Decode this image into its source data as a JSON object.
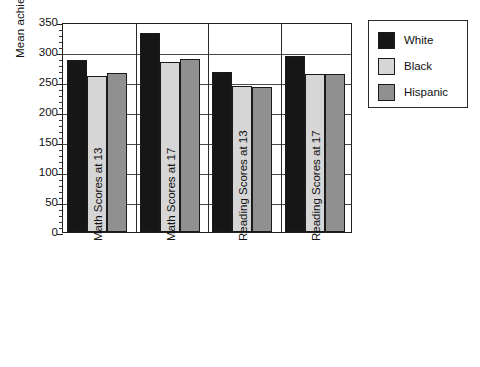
{
  "chart_data": {
    "type": "bar",
    "title": "",
    "xlabel": "",
    "ylabel": "Mean achievement score",
    "ylim": [
      0,
      350
    ],
    "ytick_step": 50,
    "yticks": [
      0,
      50,
      100,
      150,
      200,
      250,
      300,
      350
    ],
    "ytick_labels": [
      "0",
      "50",
      "100",
      "150",
      "200",
      "250",
      "300",
      "350"
    ],
    "grid": "horizontal",
    "legend_position": "right-outside",
    "categories": [
      "Math Scores at 13",
      "Math Scores at 17",
      "Reading Scores at 13",
      "Reading Scores at 17"
    ],
    "series": [
      {
        "name": "White",
        "color": "#161616",
        "values": [
          287,
          331,
          267,
          293
        ]
      },
      {
        "name": "Black",
        "color": "#d6d6d6",
        "values": [
          260,
          283,
          243,
          263
        ]
      },
      {
        "name": "Hispanic",
        "color": "#909090",
        "values": [
          265,
          289,
          241,
          263
        ]
      }
    ]
  },
  "legend": {
    "items": [
      {
        "label": "White"
      },
      {
        "label": "Black"
      },
      {
        "label": "Hispanic"
      }
    ]
  },
  "axes": {
    "y_title": "Mean achievement score"
  }
}
